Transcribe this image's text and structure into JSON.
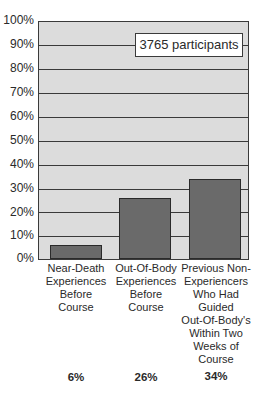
{
  "chart_data": {
    "type": "bar",
    "title": "",
    "xlabel": "",
    "ylabel": "",
    "ylim": [
      0,
      100
    ],
    "yticks": [
      "0%",
      "10%",
      "20%",
      "30%",
      "40%",
      "50%",
      "60%",
      "70%",
      "80%",
      "90%",
      "100%"
    ],
    "grid": true,
    "annotation": "3765 participants",
    "categories": [
      "Near-Death Experiences Before Course",
      "Out-Of-Body Experiences Before Course",
      "Previous Non-Experiencers Who Had Guided Out-Of-Body's Within Two Weeks of Course"
    ],
    "values": [
      6,
      26,
      34
    ],
    "value_labels": [
      "6%",
      "26%",
      "34%"
    ],
    "colors": {
      "bar": "#6a6a6a",
      "plot_bg": "#dcdcdc",
      "grid": "#3a3a3a"
    }
  },
  "axis": {
    "ticks": {
      "t0": "0%",
      "t10": "10%",
      "t20": "20%",
      "t30": "30%",
      "t40": "40%",
      "t50": "50%",
      "t60": "60%",
      "t70": "70%",
      "t80": "80%",
      "t90": "90%",
      "t100": "100%"
    }
  },
  "labels": {
    "cat1": [
      "Near-Death",
      "Experiences",
      "Before",
      "Course"
    ],
    "cat2": [
      "Out-Of-Body",
      "Experiences",
      "Before",
      "Course"
    ],
    "cat3": [
      "Previous Non-",
      "Experiencers",
      "Who Had",
      "Guided",
      "Out-Of-Body's",
      "Within Two",
      "Weeks of",
      "Course"
    ]
  }
}
